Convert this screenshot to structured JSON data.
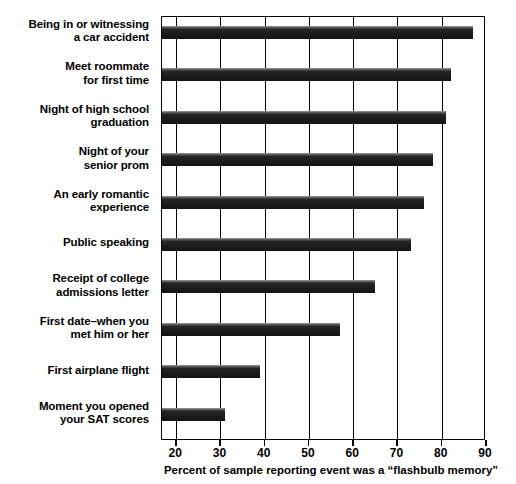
{
  "chart_data": {
    "type": "bar",
    "orientation": "horizontal",
    "title": "",
    "xlabel": "Percent of sample reporting event was a “flashbulb memory”",
    "ylabel": "",
    "xlim": [
      16.8,
      90
    ],
    "xticks": [
      20,
      30,
      40,
      50,
      60,
      70,
      80,
      90
    ],
    "xtick_labels": [
      "20",
      "30",
      "40",
      "50",
      "60",
      "70",
      "80",
      "90"
    ],
    "grid": true,
    "grid_axis": "x",
    "legend": false,
    "bar_color": "#1c1c1c",
    "categories": [
      "Being in or witnessing a car accident",
      "Meet roommate for first time",
      "Night of high school graduation",
      "Night of your senior prom",
      "An early romantic experience",
      "Public speaking",
      "Receipt of college admissions letter",
      "First date–when you met him or her",
      "First airplane flight",
      "Moment you opened your SAT scores"
    ],
    "category_lines": [
      [
        "Being in or witnessing",
        "a car accident"
      ],
      [
        "Meet roommate",
        "for first time"
      ],
      [
        "Night of high school",
        "graduation"
      ],
      [
        "Night of your",
        "senior prom"
      ],
      [
        "An early romantic",
        "experience"
      ],
      [
        "Public speaking",
        ""
      ],
      [
        "Receipt of college",
        "admissions letter"
      ],
      [
        "First date–when you",
        "met him or her"
      ],
      [
        "First airplane flight",
        ""
      ],
      [
        "Moment you opened",
        "your SAT scores"
      ]
    ],
    "values": [
      87,
      82,
      81,
      78,
      76,
      73,
      65,
      57,
      39,
      31
    ]
  }
}
